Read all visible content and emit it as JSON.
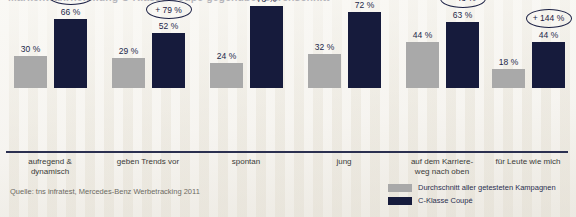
{
  "title": "Markenwahrnehmung C-Klasse Coupé gegenüber Durchschnitt",
  "source": "Quelle: tns infratest, Mercedes-Benz Werbetracking 2011",
  "legend": {
    "items": [
      {
        "label": "Durchschnitt aller getesteten Kampagnen",
        "color": "#a9a9a9"
      },
      {
        "label": "C-Klasse Coupé",
        "color": "#161b3c"
      }
    ]
  },
  "colors": {
    "average_bar": "#a9a9a9",
    "coupe_bar": "#161b3c",
    "axis": "#2b3050",
    "badge_outline": "#1b2044",
    "background": "#f2f0ea",
    "label_text": "#3a3b38"
  },
  "chart_data": {
    "type": "bar",
    "title": "Markenwahrnehmung C-Klasse Coupé gegenüber Durchschnitt",
    "xlabel": "",
    "ylabel": "",
    "ylim": [
      0,
      100
    ],
    "grid": false,
    "legend_position": "bottom-right",
    "categories": [
      "aufregend & dynamisch",
      "geben Trends vor",
      "spontan",
      "jung",
      "auf dem Karriere- weg nach oben",
      "für Leute wie mich"
    ],
    "category_lines": [
      [
        "aufregend &",
        "dynamisch"
      ],
      [
        "geben Trends vor",
        ""
      ],
      [
        "spontan",
        ""
      ],
      [
        "jung",
        ""
      ],
      [
        "auf dem Karriere-",
        "weg nach oben"
      ],
      [
        "für Leute wie mich",
        ""
      ]
    ],
    "series": [
      {
        "name": "Durchschnitt aller getesteten Kampagnen",
        "color": "#a9a9a9",
        "values": [
          30,
          29,
          24,
          32,
          44,
          18
        ],
        "value_labels": [
          "30 %",
          "29 %",
          "24 %",
          "32 %",
          "44 %",
          "18 %"
        ]
      },
      {
        "name": "C-Klasse Coupé",
        "color": "#161b3c",
        "values": [
          66,
          52,
          78,
          72,
          63,
          44
        ],
        "value_labels": [
          "66 %",
          "52 %",
          "78 %",
          "72 %",
          "63 %",
          "44 %"
        ]
      }
    ],
    "annotations": {
      "type": "uplift-badge",
      "values": [
        120,
        79,
        225,
        125,
        43,
        144
      ],
      "labels": [
        "+ 120 %",
        "+ 79 %",
        "+ 225 %",
        "+ 125 %",
        "+ 43 %",
        "+ 144 %"
      ]
    }
  }
}
